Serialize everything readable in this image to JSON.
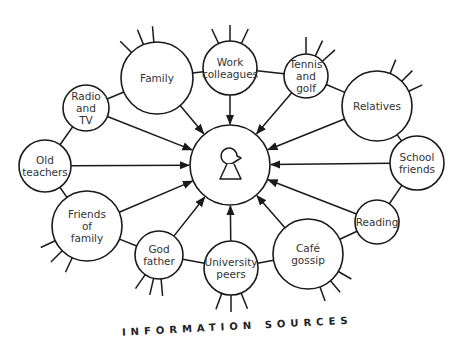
{
  "diagram": {
    "title": "INFORMATION SOURCES",
    "center": {
      "name": "person",
      "icon": "person-keyhole-icon",
      "x": 230,
      "y": 165,
      "r": 40
    },
    "stroke_color": "#1a1a1a",
    "text_color": "#333333",
    "nodes": [
      {
        "id": "family",
        "lines": [
          "Family"
        ],
        "x": 157,
        "y": 78,
        "r": 36,
        "spokes": [
          [
            -135,
            16
          ],
          [
            -112,
            16
          ],
          [
            -95,
            16
          ]
        ]
      },
      {
        "id": "work-colleagues",
        "lines": [
          "Work",
          "colleagues"
        ],
        "x": 230,
        "y": 68,
        "r": 27,
        "spokes": [
          [
            -115,
            16
          ],
          [
            -90,
            16
          ],
          [
            -65,
            16
          ]
        ]
      },
      {
        "id": "tennis-and-golf",
        "lines": [
          "Tennis",
          "and",
          "golf"
        ],
        "x": 306,
        "y": 76,
        "r": 22,
        "spokes": [
          [
            -90,
            17
          ],
          [
            -65,
            17
          ],
          [
            -42,
            17
          ]
        ]
      },
      {
        "id": "relatives",
        "lines": [
          "Relatives"
        ],
        "x": 377,
        "y": 106,
        "r": 35,
        "spokes": [
          [
            -68,
            15
          ],
          [
            -45,
            15
          ],
          [
            -25,
            15
          ]
        ]
      },
      {
        "id": "school-friends",
        "lines": [
          "School",
          "friends"
        ],
        "x": 417,
        "y": 163,
        "r": 27,
        "spokes": []
      },
      {
        "id": "reading",
        "lines": [
          "Reading"
        ],
        "x": 377,
        "y": 222,
        "r": 22,
        "spokes": []
      },
      {
        "id": "cafe-gossip",
        "lines": [
          "Café",
          "gossip"
        ],
        "x": 308,
        "y": 254,
        "r": 35,
        "spokes": [
          [
            30,
            15
          ],
          [
            50,
            15
          ],
          [
            70,
            15
          ]
        ]
      },
      {
        "id": "university-peers",
        "lines": [
          "University",
          "peers"
        ],
        "x": 231,
        "y": 268,
        "r": 27,
        "spokes": [
          [
            110,
            17
          ],
          [
            90,
            17
          ],
          [
            68,
            17
          ]
        ]
      },
      {
        "id": "god-father",
        "lines": [
          "God",
          "father"
        ],
        "x": 159,
        "y": 255,
        "r": 24,
        "spokes": [
          [
            125,
            17
          ],
          [
            103,
            17
          ],
          [
            85,
            17
          ]
        ]
      },
      {
        "id": "friends-of-family",
        "lines": [
          "Friends",
          "of",
          "family"
        ],
        "x": 87,
        "y": 226,
        "r": 35,
        "spokes": [
          [
            155,
            16
          ],
          [
            135,
            16
          ],
          [
            115,
            16
          ]
        ]
      },
      {
        "id": "old-teachers",
        "lines": [
          "Old",
          "teachers"
        ],
        "x": 45,
        "y": 166,
        "r": 26,
        "spokes": []
      },
      {
        "id": "radio-and-tv",
        "lines": [
          "Radio",
          "and",
          "TV"
        ],
        "x": 86,
        "y": 108,
        "r": 23,
        "spokes": []
      }
    ],
    "ring_links": [
      [
        "family",
        "work-colleagues"
      ],
      [
        "work-colleagues",
        "tennis-and-golf"
      ],
      [
        "tennis-and-golf",
        "relatives"
      ],
      [
        "relatives",
        "school-friends"
      ],
      [
        "school-friends",
        "reading"
      ],
      [
        "reading",
        "cafe-gossip"
      ],
      [
        "cafe-gossip",
        "university-peers"
      ],
      [
        "university-peers",
        "god-father"
      ],
      [
        "god-father",
        "friends-of-family"
      ],
      [
        "friends-of-family",
        "old-teachers"
      ],
      [
        "old-teachers",
        "radio-and-tv"
      ],
      [
        "radio-and-tv",
        "family"
      ]
    ]
  }
}
